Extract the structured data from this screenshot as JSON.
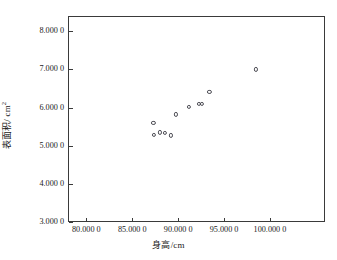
{
  "chart_data": {
    "type": "scatter",
    "title": "",
    "xlabel": "身高/cm",
    "ylabel": "表面积/ cm²",
    "ylabel_base": "表面积/ cm",
    "ylabel_sup": "2",
    "xlim": [
      78.0,
      106.0
    ],
    "ylim": [
      3000.0,
      8400.0
    ],
    "grid": false,
    "legend": "none",
    "marker": "open-circle",
    "marker_color": "#4a4a52",
    "xticks": [
      80.0,
      85.0,
      90.0,
      95.0,
      100.0
    ],
    "xticklabels": [
      "80.000 0",
      "85.000 0",
      "90.000 0",
      "95.000 0",
      "100.000 0"
    ],
    "yticks": [
      3000,
      4000,
      5000,
      6000,
      7000,
      8000
    ],
    "yticklabels": [
      "3.000 0",
      "4.000 0",
      "5.000 0",
      "6.000 0",
      "7.000 0",
      "8.000 0"
    ],
    "points": [
      {
        "x": 87.3,
        "y": 5600
      },
      {
        "x": 87.4,
        "y": 5280
      },
      {
        "x": 88.0,
        "y": 5350
      },
      {
        "x": 88.55,
        "y": 5330
      },
      {
        "x": 89.2,
        "y": 5270
      },
      {
        "x": 89.8,
        "y": 5820
      },
      {
        "x": 91.2,
        "y": 6010
      },
      {
        "x": 92.3,
        "y": 6090
      },
      {
        "x": 92.55,
        "y": 6100
      },
      {
        "x": 93.4,
        "y": 6420
      },
      {
        "x": 98.5,
        "y": 7000
      }
    ],
    "series": [
      {
        "name": "观测值",
        "x": [
          87.3,
          87.4,
          88.0,
          88.55,
          89.2,
          89.8,
          91.2,
          92.3,
          92.55,
          93.4,
          98.5
        ],
        "values": [
          5600,
          5280,
          5350,
          5330,
          5270,
          5820,
          6010,
          6090,
          6100,
          6420,
          7000
        ]
      }
    ]
  },
  "colors": {
    "axis": "#3a3a3a",
    "marker": "#4a4a52",
    "background": "#ffffff",
    "text": "#1a1a1a"
  }
}
